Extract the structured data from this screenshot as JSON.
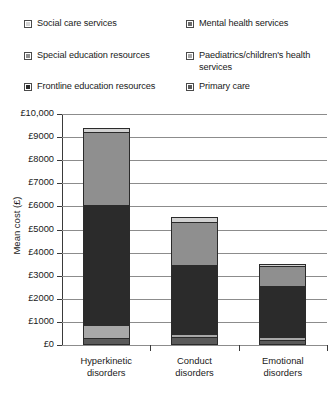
{
  "legend": {
    "items": [
      {
        "label": "Social care services",
        "color": "#d2d2d2",
        "swatch_name": "legend-swatch-social-care-services"
      },
      {
        "label": "Special education resources",
        "color": "#8f8f8f",
        "swatch_name": "legend-swatch-special-education-resources"
      },
      {
        "label": "Frontline education resources",
        "color": "#2b2b2b",
        "swatch_name": "legend-swatch-frontline-education-resources"
      },
      {
        "label": "Mental health services",
        "color": "#6b6b6b",
        "swatch_name": "legend-swatch-mental-health-services"
      },
      {
        "label": "Paediatrics/children's health services",
        "color": "#a8a8a8",
        "swatch_name": "legend-swatch-paediatrics-childrens-health-services"
      },
      {
        "label": "Primary care",
        "color": "#5a5a5a",
        "swatch_name": "legend-swatch-primary-care"
      }
    ]
  },
  "axis": {
    "y_label": "Mean cost (£)",
    "y_ticks": [
      "£10,000",
      "£9000",
      "£8000",
      "£7000",
      "£6000",
      "£5000",
      "£4000",
      "£3000",
      "£2000",
      "£1000",
      "£0"
    ]
  },
  "chart_data": {
    "type": "bar",
    "subtype": "stacked",
    "title": "",
    "xlabel": "",
    "ylabel": "Mean cost (£)",
    "ylim": [
      0,
      10000
    ],
    "ytick_values": [
      0,
      1000,
      2000,
      3000,
      4000,
      5000,
      6000,
      7000,
      8000,
      9000,
      10000
    ],
    "ytick_labels": [
      "£0",
      "£1000",
      "£2000",
      "£3000",
      "£4000",
      "£5000",
      "£6000",
      "£7000",
      "£8000",
      "£9000",
      "£10,000"
    ],
    "grid": true,
    "legend_position": "top",
    "categories": [
      "Hyperkinetic disorders",
      "Conduct disorders",
      "Emotional disorders"
    ],
    "category_lines": [
      [
        "Hyperkinetic",
        "disorders"
      ],
      [
        "Conduct",
        "disorders"
      ],
      [
        "Emotional",
        "disorders"
      ]
    ],
    "stack_order_bottom_to_top": [
      "Primary care",
      "Paediatrics/children's health services",
      "Frontline education resources",
      "Special education resources",
      "Social care services"
    ],
    "series": [
      {
        "name": "Primary care",
        "color": "#5a5a5a",
        "values": [
          200,
          250,
          150
        ]
      },
      {
        "name": "Paediatrics/children's health services",
        "color": "#a8a8a8",
        "values": [
          600,
          150,
          100
        ]
      },
      {
        "name": "Frontline education resources",
        "color": "#2b2b2b",
        "values": [
          5250,
          3050,
          2300
        ]
      },
      {
        "name": "Special education resources",
        "color": "#8f8f8f",
        "values": [
          3150,
          1850,
          850
        ]
      },
      {
        "name": "Social care services",
        "color": "#d2d2d2",
        "values": [
          200,
          250,
          100
        ]
      }
    ],
    "totals": [
      9400,
      5550,
      3500
    ]
  }
}
